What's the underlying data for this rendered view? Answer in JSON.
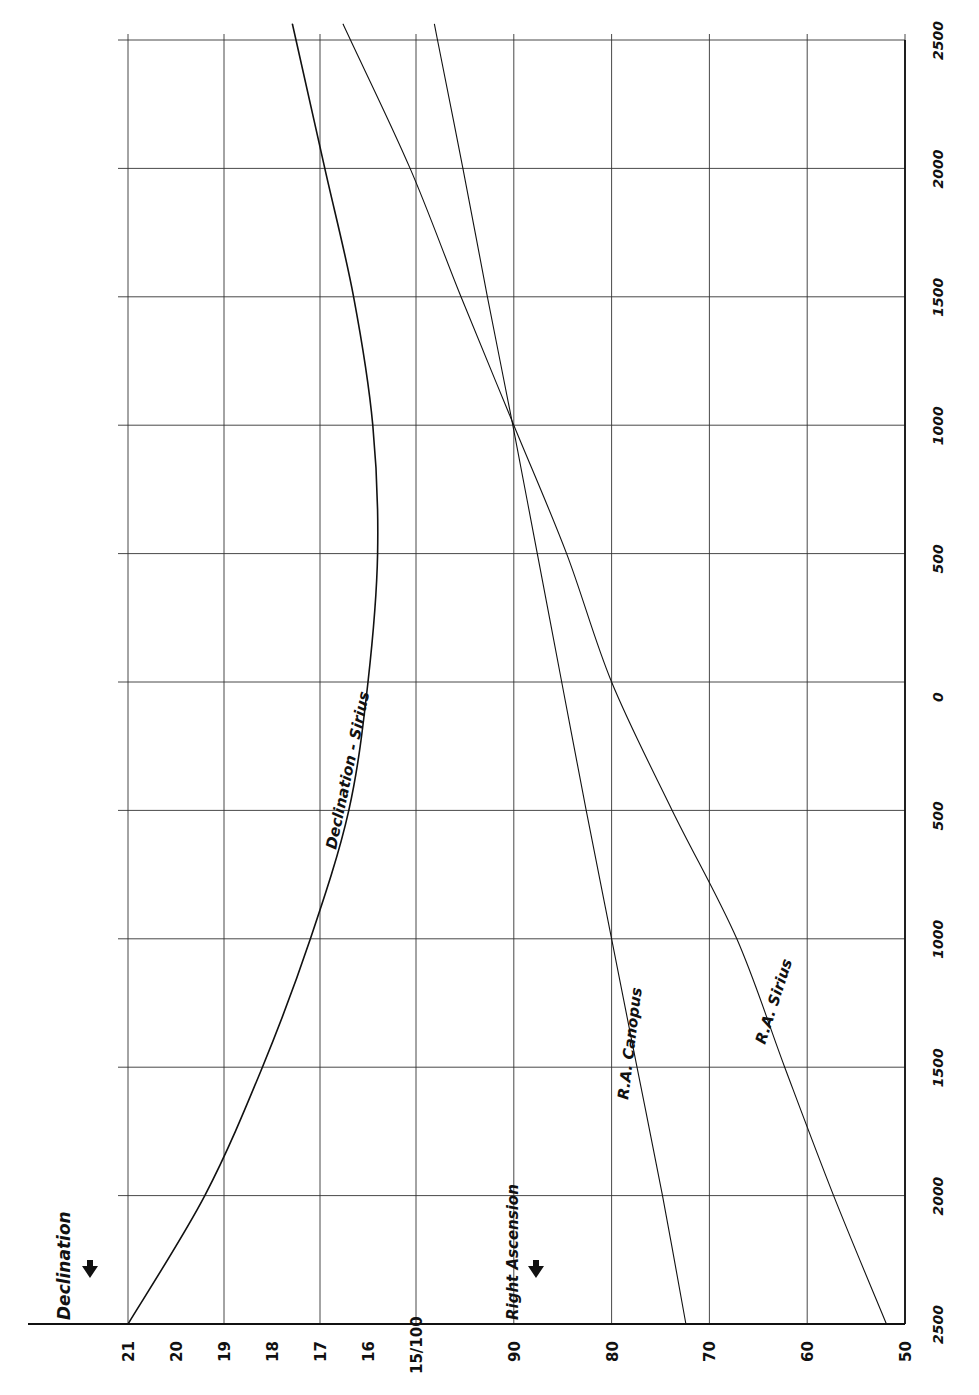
{
  "chart_data": {
    "type": "line",
    "title": "",
    "orientation": "rotated 90° counter-clockwise (time axis vertical, values horizontal)",
    "xlabel": "Year (2500 BC to 2500 AD)",
    "x_tick_labels": [
      "2500",
      "2000",
      "1500",
      "1000",
      "500",
      "0",
      "500",
      "1000",
      "1500",
      "2000",
      "2500"
    ],
    "x": [
      -2500,
      -2000,
      -1500,
      -1000,
      -500,
      0,
      500,
      1000,
      1500,
      2000,
      2500
    ],
    "xlim": [
      -2500,
      2500
    ],
    "axes": {
      "declination": {
        "label": "Declination",
        "tick_labels": [
          "21",
          "20",
          "19",
          "18",
          "17",
          "16",
          "15"
        ],
        "ticks": [
          21,
          20,
          19,
          18,
          17,
          16,
          15
        ],
        "range": [
          21,
          15
        ],
        "gridlines": [
          21,
          19,
          17,
          15
        ]
      },
      "right_ascension": {
        "label": "Right Ascension",
        "tick_labels": [
          "100",
          "90",
          "80",
          "70",
          "60",
          "50"
        ],
        "ticks": [
          100,
          90,
          80,
          70,
          60,
          50
        ],
        "range": [
          100,
          50
        ],
        "gridlines": [
          90,
          80,
          70,
          60,
          50
        ]
      },
      "shared_label": "15/100"
    },
    "series": [
      {
        "name": "Declination - Sirius",
        "axis": "declination",
        "values": [
          21.0,
          19.4,
          18.2,
          17.2,
          16.4,
          16.0,
          15.8,
          15.9,
          16.3,
          16.9,
          17.5
        ]
      },
      {
        "name": "R.A. Canopus",
        "axis": "right_ascension",
        "values": [
          72.4,
          74.8,
          77.4,
          80.0,
          82.6,
          85.1,
          87.6,
          90.1,
          92.7,
          95.2,
          97.8
        ]
      },
      {
        "name": "R.A. Sirius",
        "axis": "right_ascension",
        "values": [
          51.9,
          57.3,
          62.3,
          67.2,
          73.8,
          80.0,
          84.6,
          90.0,
          95.4,
          100.6,
          106.7
        ]
      }
    ],
    "grid": true,
    "legend": "inline labels along curves"
  },
  "labels": {
    "declination_title": "Declination",
    "ra_title": "Right Ascension",
    "series_declination_sirius": "Declination - Sirius",
    "series_ra_canopus": "R.A. Canopus",
    "series_ra_sirius": "R.A. Sirius"
  }
}
